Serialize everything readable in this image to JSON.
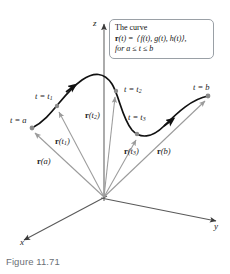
{
  "figure": {
    "caption": "Figure 11.71",
    "axes": [
      {
        "name": "z-axis",
        "label": "z"
      },
      {
        "name": "y-axis",
        "label": "y"
      },
      {
        "name": "x-axis",
        "label": "x"
      }
    ],
    "callout": {
      "line1": "The curve",
      "line2_lead": "r",
      "line2_rest": "(t) = ⟨ f(t), g(t), h(t)⟩,",
      "line3": "for a ≤ t ≤ b"
    },
    "curve_point_labels": [
      {
        "name": "label-t-equals-a",
        "text": "t = a",
        "x": 10,
        "y": 116
      },
      {
        "name": "label-t-equals-t1",
        "text": "t = t",
        "sub": "1",
        "x": 35,
        "y": 92
      },
      {
        "name": "label-t-equals-t2",
        "text": "t = t",
        "sub": "2",
        "x": 124,
        "y": 85
      },
      {
        "name": "label-t-equals-t3",
        "text": "t = t",
        "sub": "3",
        "x": 128,
        "y": 113
      },
      {
        "name": "label-t-equals-b",
        "text": "t = b",
        "x": 193,
        "y": 83
      }
    ],
    "vector_labels": [
      {
        "name": "label-vector-r-of-a",
        "bold": "r",
        "rest": "(a)",
        "x": 37,
        "y": 157
      },
      {
        "name": "label-vector-r-of-t1",
        "bold": "r",
        "rest": "(t",
        "sub": "1",
        "tail": ")",
        "x": 55,
        "y": 137
      },
      {
        "name": "label-vector-r-of-t2",
        "bold": "r",
        "rest": "(t",
        "sub": "2",
        "tail": ")",
        "x": 85,
        "y": 111
      },
      {
        "name": "label-vector-r-of-t3",
        "bold": "r",
        "rest": "(t",
        "sub": "3",
        "tail": ")",
        "x": 124,
        "y": 147
      },
      {
        "name": "label-vector-r-of-b",
        "bold": "r",
        "rest": "(b)",
        "x": 157,
        "y": 147
      }
    ],
    "colors": {
      "curve": "#111111",
      "vector": "#9b9b9b",
      "axis": "#5a5a5a",
      "point": "#8a8a8a",
      "callout_border": "#9aa0a6",
      "caption": "#6b6f76"
    },
    "geometry": {
      "origin": {
        "x": 104,
        "y": 197
      },
      "curve_path": "M 32,128 C 52,118 62,94 82,80 C 94,72 104,72 112,84 C 119,95 122,118 132,130 C 140,139 152,138 164,126 C 178,112 192,99 208,96",
      "curve_points": [
        {
          "name": "t = a",
          "x": 32,
          "y": 128
        },
        {
          "name": "t = t1",
          "x": 57,
          "y": 106
        },
        {
          "name": "t = t2",
          "x": 116,
          "y": 91
        },
        {
          "name": "t = t3",
          "x": 137,
          "y": 134
        },
        {
          "name": "t = b",
          "x": 208,
          "y": 96
        }
      ],
      "vectors": [
        {
          "name": "r(a)",
          "x2": 32,
          "y2": 128
        },
        {
          "name": "r(t1)",
          "x2": 57,
          "y2": 106
        },
        {
          "name": "r(t2)",
          "x2": 116,
          "y2": 91
        },
        {
          "name": "r(t3)",
          "x2": 137,
          "y2": 134
        },
        {
          "name": "r(b)",
          "x2": 208,
          "y2": 96
        }
      ]
    }
  }
}
